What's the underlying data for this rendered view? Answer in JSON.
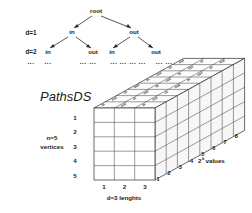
{
  "figure": {
    "title_label": "PathsDS",
    "tree": {
      "root_label": "root",
      "depth_labels": [
        "d=1",
        "d=2",
        "..."
      ],
      "level1": [
        "in",
        "out"
      ],
      "level2": [
        "in",
        "out",
        "in",
        "out"
      ],
      "ellipsis_row": [
        "...",
        "... ...",
        "... ... ... ...",
        "... ..."
      ]
    },
    "cube": {
      "left_axis_label_line1": "n=5",
      "left_axis_label_line2": "vertices",
      "left_axis_ticks": [
        "1",
        "2",
        "3",
        "4",
        "5"
      ],
      "bottom_axis_label": "d=3 lenghts",
      "bottom_axis_ticks": [
        "1",
        "2",
        "3"
      ],
      "depth_axis_label_base": "2",
      "depth_axis_label_exp": "k",
      "depth_axis_label_tail": "values",
      "depth_axis_ticks": [
        "1",
        "2",
        "3",
        "4",
        "5",
        "6",
        "7",
        "8"
      ],
      "top_cell_labels": [
        "in",
        "out",
        "in",
        "out",
        "in",
        "out",
        "in",
        "out",
        "in",
        "out",
        "in",
        "out",
        "in",
        "out",
        "in",
        "out",
        "in",
        "out",
        "in",
        "out",
        "in",
        "out",
        "in",
        "out"
      ]
    },
    "colors": {
      "ink": "#1b1b1b",
      "edge": "#2b2b2b",
      "edge_light": "#4a4a4a",
      "background": "#ffffff"
    }
  }
}
